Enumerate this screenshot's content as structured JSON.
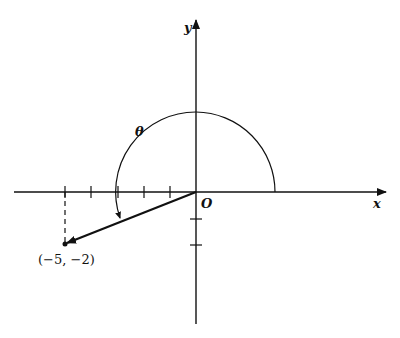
{
  "diagram": {
    "axes": {
      "x_label": "x",
      "y_label": "y",
      "origin_label": "O"
    },
    "angle_label": "θ",
    "point": {
      "label": "(−5, −2)",
      "x": -5,
      "y": -2
    },
    "x_ticks": [
      -5,
      -4,
      -3,
      -2,
      -1
    ],
    "y_ticks": [
      -1,
      -2
    ],
    "colors": {
      "ink": "#111111",
      "background": "#ffffff"
    }
  }
}
